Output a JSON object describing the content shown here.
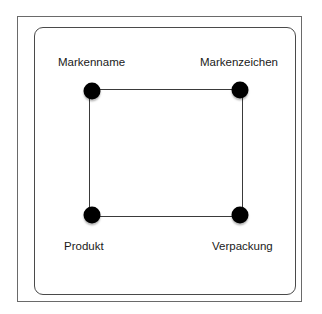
{
  "diagram": {
    "type": "quadrilateral-node-diagram",
    "nodes": [
      {
        "id": "markenname",
        "label": "Markenname",
        "position": "top-left"
      },
      {
        "id": "markenzeichen",
        "label": "Markenzeichen",
        "position": "top-right"
      },
      {
        "id": "produkt",
        "label": "Produkt",
        "position": "bottom-left"
      },
      {
        "id": "verpackung",
        "label": "Verpackung",
        "position": "bottom-right"
      }
    ],
    "edges": [
      {
        "from": "markenname",
        "to": "markenzeichen"
      },
      {
        "from": "markenzeichen",
        "to": "verpackung"
      },
      {
        "from": "verpackung",
        "to": "produkt"
      },
      {
        "from": "produkt",
        "to": "markenname"
      }
    ],
    "colors": {
      "node": "#000000",
      "edge": "#3a3a3a",
      "frame": "#4a4a4a",
      "text": "#1a1a1a"
    }
  }
}
